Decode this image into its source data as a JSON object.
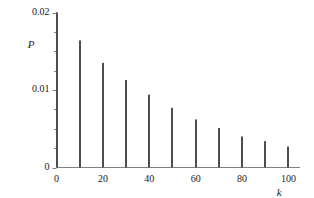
{
  "chart_data": {
    "type": "bar",
    "title": "",
    "subtitle": "",
    "xlabel": "k",
    "ylabel": "P",
    "categories": [
      0,
      10,
      20,
      30,
      40,
      50,
      60,
      70,
      80,
      90,
      100
    ],
    "values": [
      0.02,
      0.0164,
      0.0135,
      0.0113,
      0.0094,
      0.0077,
      0.0062,
      0.0051,
      0.004,
      0.0034,
      0.0027
    ],
    "series": [
      {
        "name": "P(k)",
        "values": [
          0.02,
          0.0164,
          0.0135,
          0.0113,
          0.0094,
          0.0077,
          0.0062,
          0.0051,
          0.004,
          0.0034,
          0.0027
        ]
      }
    ],
    "xlim": [
      0,
      105
    ],
    "ylim": [
      0,
      0.02
    ],
    "xticks": [
      0,
      20,
      40,
      60,
      80,
      100
    ],
    "xtick_labels": [
      "0",
      "20",
      "40",
      "60",
      "80",
      "100"
    ],
    "xminor_ticks": [
      10,
      30,
      50,
      70,
      90
    ],
    "yticks": [
      0,
      0.01,
      0.02
    ],
    "ytick_labels": [
      "0",
      "0.01",
      "0.02"
    ],
    "yminor_ticks": [
      0.0025,
      0.005,
      0.0075,
      0.0125,
      0.015,
      0.0175
    ],
    "grid": false,
    "legend": null,
    "legend_position": "none",
    "annotations": [],
    "bar_color": "#4d4d4d",
    "axis_color": "#808080",
    "text_color": "#1a1a1a",
    "background": "#ffffff",
    "bar_width_px": 2
  },
  "axes": {
    "y_axis_name": "P",
    "x_axis_name": "k",
    "y_tick_0": "0",
    "y_tick_1": "0.01",
    "y_tick_2": "0.02",
    "x_tick_0": "0",
    "x_tick_1": "20",
    "x_tick_2": "40",
    "x_tick_3": "60",
    "x_tick_4": "80",
    "x_tick_5": "100"
  }
}
